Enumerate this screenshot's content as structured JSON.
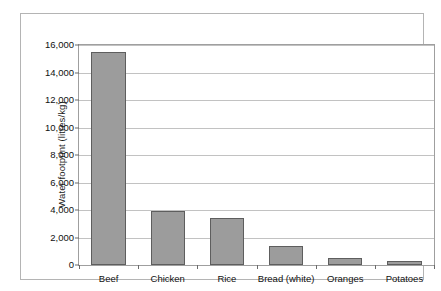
{
  "chart_data": {
    "type": "bar",
    "title": "",
    "subtitle": "",
    "xlabel": "",
    "ylabel": "Water footprint (litres/kg)",
    "categories": [
      "Beef",
      "Chicken",
      "Rice",
      "Bread (white)",
      "Oranges",
      "Potatoes"
    ],
    "values": [
      15500,
      3900,
      3450,
      1350,
      500,
      290
    ],
    "series": [
      {
        "name": "Water footprint",
        "values": [
          15500,
          3900,
          3450,
          1350,
          500,
          290
        ]
      }
    ],
    "ylim": [
      0,
      16000
    ],
    "ytick_step": 2000,
    "ytick_labels": [
      "0",
      "2,000",
      "4,000",
      "6,000",
      "8,000",
      "10,000",
      "12,000",
      "14,000",
      "16,000"
    ],
    "ytick_values": [
      0,
      2000,
      4000,
      6000,
      8000,
      10000,
      12000,
      14000,
      16000
    ],
    "grid": true,
    "legend": false,
    "legend_position": "none",
    "colors": {
      "bar_fill": "#9c9c9c",
      "bar_stroke": "#5e5e5e",
      "gridline": "#c2c2c2",
      "plot_border": "#9f9f9f",
      "frame_border": "#b4b4b4",
      "text": "#111111",
      "background": "#ffffff"
    }
  }
}
